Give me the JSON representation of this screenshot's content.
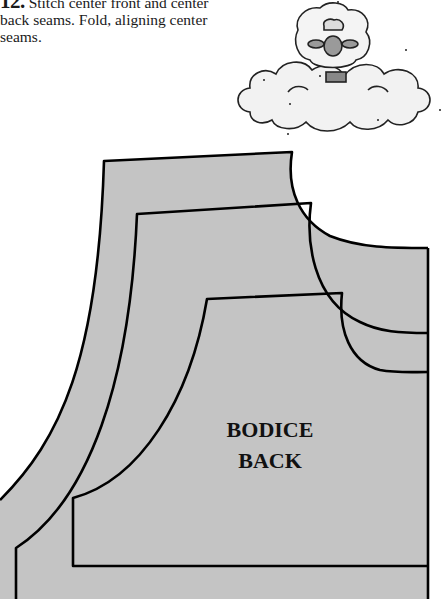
{
  "instructions": {
    "step_number": "12.",
    "text": " Stitch center front and center back seams. Fold, aligning center seams."
  },
  "illustration": {
    "subject": "sheep-on-cloud"
  },
  "pattern": {
    "label_line1": "BODICE",
    "label_line2": "BACK",
    "fill_color": "#c4c4c4",
    "line_color": "#000000",
    "size_lines": [
      "outer",
      "middle",
      "inner"
    ]
  }
}
